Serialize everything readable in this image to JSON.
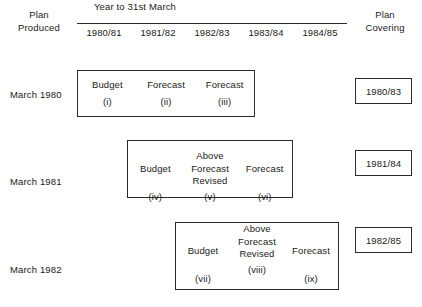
{
  "header": {
    "left_label_line1": "Plan",
    "left_label_line2": "Produced",
    "span_title": "Year to 31st March",
    "right_label_line1": "Plan",
    "right_label_line2": "Covering",
    "years": [
      "1980/81",
      "1981/82",
      "1982/83",
      "1983/84",
      "1984/85"
    ]
  },
  "rows": [
    {
      "produced": "March 1980",
      "covering": "1980/83",
      "cells": [
        {
          "title": "Budget",
          "ref": "(i)"
        },
        {
          "title": "Forecast",
          "ref": "(ii)"
        },
        {
          "title": "Forecast",
          "ref": "(iii)"
        }
      ]
    },
    {
      "produced": "March 1981",
      "covering": "1981/84",
      "cells": [
        {
          "title": "Budget",
          "ref": "(iv)"
        },
        {
          "title_line1": "Above",
          "title_line2": "Forecast",
          "title_line3": "Revised",
          "ref": "(v)"
        },
        {
          "title": "Forecast",
          "ref": "(vi)"
        }
      ]
    },
    {
      "produced": "March 1982",
      "covering": "1982/85",
      "cells": [
        {
          "title": "Budget",
          "ref": "(vii)"
        },
        {
          "title_line1": "Above",
          "title_line2": "Forecast",
          "title_line3": "Revised",
          "ref": "(viii)"
        },
        {
          "title": "Forecast",
          "ref": "(ix)"
        }
      ]
    }
  ],
  "colors": {
    "ink": "#2b2b2b",
    "paper": "#ffffff"
  }
}
